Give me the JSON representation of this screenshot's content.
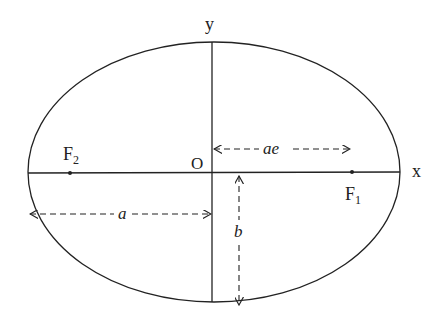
{
  "diagram": {
    "colors": {
      "stroke": "#222222",
      "background": "#ffffff"
    },
    "ellipse": {
      "cx": 214,
      "cy": 172,
      "rx": 186,
      "ry": 130
    },
    "axes": {
      "x_label": "x",
      "y_label": "y",
      "origin_label": "O"
    },
    "foci": [
      {
        "label": "F",
        "subscript": "2",
        "x": 70,
        "y": 173
      },
      {
        "label": "F",
        "subscript": "1",
        "x": 352,
        "y": 172
      }
    ],
    "dimensions": {
      "focal_distance_label": "ae",
      "semi_major_label": "a",
      "semi_minor_label": "b"
    }
  }
}
